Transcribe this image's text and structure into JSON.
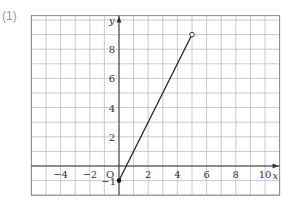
{
  "problem_label": "(1)",
  "chart_data": {
    "type": "line",
    "title": "",
    "xlabel": "x",
    "ylabel": "y",
    "origin_label": "O",
    "xlim": [
      -6,
      11
    ],
    "ylim": [
      -2,
      10.3
    ],
    "grid": true,
    "x_ticks": [
      -4,
      -2,
      2,
      4,
      6,
      8,
      10
    ],
    "y_ticks": [
      2,
      4,
      6,
      8
    ],
    "extra_y_tick": -1,
    "series": [
      {
        "name": "segment",
        "points": [
          {
            "x": 0,
            "y": -1,
            "marker": "closed"
          },
          {
            "x": 5,
            "y": 9,
            "marker": "open"
          }
        ]
      }
    ]
  }
}
